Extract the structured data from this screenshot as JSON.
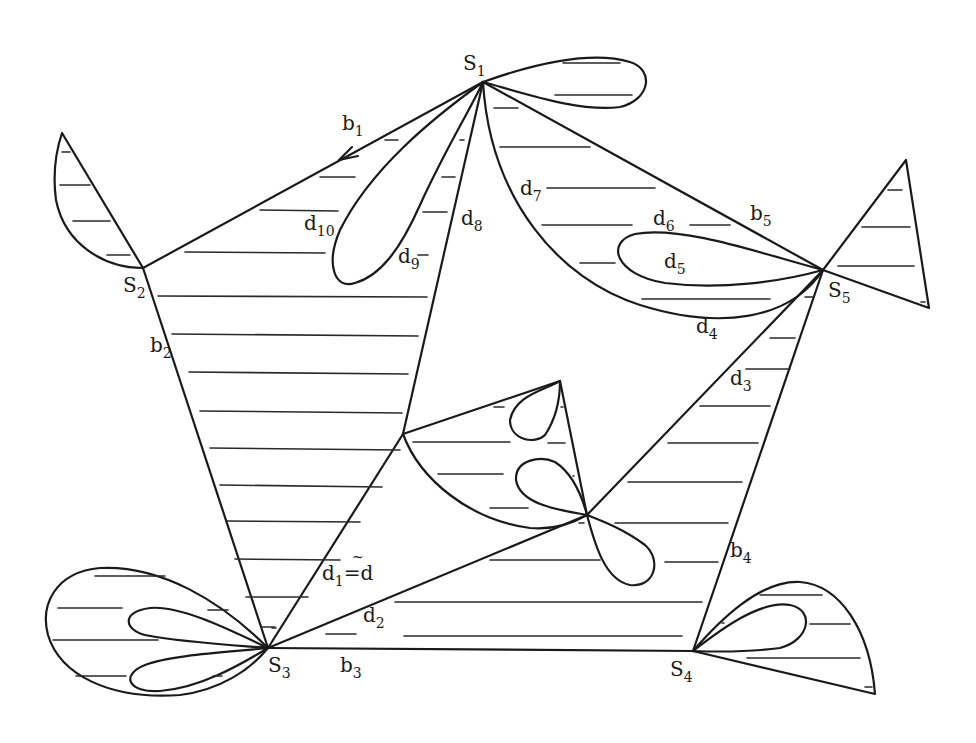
{
  "figure": {
    "vertices": [
      {
        "id": "S1",
        "label": "S",
        "sub": "1",
        "x": 483,
        "y": 82
      },
      {
        "id": "S2",
        "label": "S",
        "sub": "2",
        "x": 143,
        "y": 268
      },
      {
        "id": "S3",
        "label": "S",
        "sub": "3",
        "x": 268,
        "y": 648
      },
      {
        "id": "S4",
        "label": "S",
        "sub": "4",
        "x": 693,
        "y": 651
      },
      {
        "id": "S5",
        "label": "S",
        "sub": "5",
        "x": 823,
        "y": 270
      }
    ],
    "edge_labels": {
      "b1": {
        "main": "b",
        "sub": "1"
      },
      "b2": {
        "main": "b",
        "sub": "2"
      },
      "b3": {
        "main": "b",
        "sub": "3"
      },
      "b4": {
        "main": "b",
        "sub": "4"
      },
      "b5": {
        "main": "b",
        "sub": "5"
      },
      "d1": {
        "main": "d",
        "sub": "1",
        "suffix": "=d",
        "tilde": "~"
      },
      "d2": {
        "main": "d",
        "sub": "2"
      },
      "d3": {
        "main": "d",
        "sub": "3"
      },
      "d4": {
        "main": "d",
        "sub": "4"
      },
      "d5": {
        "main": "d",
        "sub": "5"
      },
      "d6": {
        "main": "d",
        "sub": "6"
      },
      "d7": {
        "main": "d",
        "sub": "7"
      },
      "d8": {
        "main": "d",
        "sub": "8"
      },
      "d9": {
        "main": "d",
        "sub": "9"
      },
      "d10": {
        "main": "d",
        "sub": "10"
      }
    },
    "colors": {
      "stroke": "#1a1a1a",
      "background": "#ffffff"
    }
  }
}
